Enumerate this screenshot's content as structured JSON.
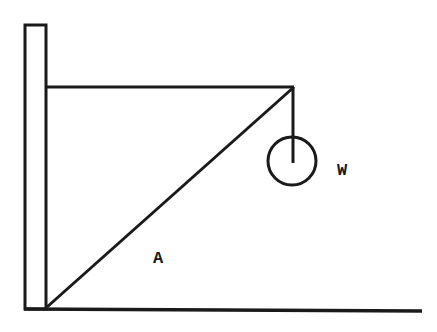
{
  "diagram": {
    "type": "statics-wall-bracket",
    "labels": {
      "strut": "A",
      "weight": "W"
    },
    "colors": {
      "stroke": "#1a1a1a",
      "background": "#ffffff"
    }
  }
}
